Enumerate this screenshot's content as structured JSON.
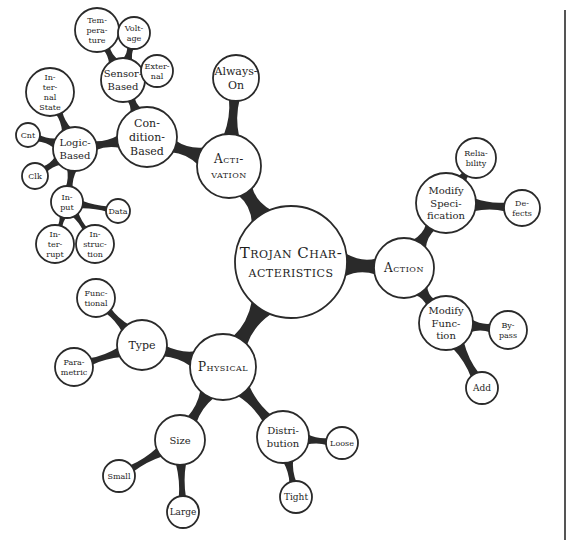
{
  "colors": {
    "stroke": "#2a2a2a",
    "fill": "#ffffff",
    "text": "#1e1e1e"
  },
  "nodes": [
    {
      "id": "root",
      "lines": [
        "Trojan Char-",
        "acteristics"
      ],
      "x": 291,
      "y": 262,
      "r": 56,
      "size": 15,
      "smallcaps": true
    },
    {
      "id": "activation",
      "lines": [
        "Acti-",
        "vation"
      ],
      "x": 229,
      "y": 166,
      "r": 32,
      "size": 12,
      "smallcaps": true
    },
    {
      "id": "action",
      "lines": [
        "Action"
      ],
      "x": 404,
      "y": 268,
      "r": 30,
      "size": 12,
      "smallcaps": true
    },
    {
      "id": "physical",
      "lines": [
        "Physical"
      ],
      "x": 223,
      "y": 367,
      "r": 33,
      "size": 12,
      "smallcaps": true
    },
    {
      "id": "always-on",
      "lines": [
        "Always-",
        "On"
      ],
      "x": 236,
      "y": 78,
      "r": 23,
      "size": 11
    },
    {
      "id": "condition-based",
      "lines": [
        "Con-",
        "dition-",
        "Based"
      ],
      "x": 147,
      "y": 137,
      "r": 30,
      "size": 11
    },
    {
      "id": "sensor-based",
      "lines": [
        "Sensor-",
        "Based"
      ],
      "x": 123,
      "y": 80,
      "r": 22,
      "size": 10
    },
    {
      "id": "temperature",
      "lines": [
        "Tem-",
        "pera-",
        "ture"
      ],
      "x": 97,
      "y": 30,
      "r": 22,
      "size": 8
    },
    {
      "id": "voltage",
      "lines": [
        "Volt-",
        "age"
      ],
      "x": 134,
      "y": 33,
      "r": 16,
      "size": 8
    },
    {
      "id": "external",
      "lines": [
        "Exter-",
        "nal"
      ],
      "x": 157,
      "y": 71,
      "r": 16,
      "size": 8
    },
    {
      "id": "logic-based",
      "lines": [
        "Logic-",
        "Based"
      ],
      "x": 75,
      "y": 149,
      "r": 22,
      "size": 10
    },
    {
      "id": "internal-state",
      "lines": [
        "In-",
        "ter-",
        "nal",
        "State"
      ],
      "x": 50,
      "y": 92,
      "r": 24,
      "size": 8
    },
    {
      "id": "cnt",
      "lines": [
        "Cnt"
      ],
      "x": 28,
      "y": 135,
      "r": 12,
      "size": 8
    },
    {
      "id": "clk",
      "lines": [
        "Clk"
      ],
      "x": 35,
      "y": 176,
      "r": 13,
      "size": 8
    },
    {
      "id": "input",
      "lines": [
        "In-",
        "put"
      ],
      "x": 67,
      "y": 202,
      "r": 16,
      "size": 8
    },
    {
      "id": "data",
      "lines": [
        "Data"
      ],
      "x": 118,
      "y": 211,
      "r": 12,
      "size": 8
    },
    {
      "id": "interrupt",
      "lines": [
        "In-",
        "ter-",
        "rupt"
      ],
      "x": 55,
      "y": 244,
      "r": 19,
      "size": 8
    },
    {
      "id": "instruction",
      "lines": [
        "In-",
        "struc-",
        "tion"
      ],
      "x": 95,
      "y": 244,
      "r": 19,
      "size": 8
    },
    {
      "id": "modify-specification",
      "lines": [
        "Modify",
        "Speci-",
        "fication"
      ],
      "x": 446,
      "y": 203,
      "r": 30,
      "size": 10
    },
    {
      "id": "reliability",
      "lines": [
        "Relia-",
        "bility"
      ],
      "x": 476,
      "y": 158,
      "r": 20,
      "size": 8
    },
    {
      "id": "defects",
      "lines": [
        "De-",
        "fects"
      ],
      "x": 522,
      "y": 208,
      "r": 18,
      "size": 8
    },
    {
      "id": "modify-function",
      "lines": [
        "Modify",
        "Func-",
        "tion"
      ],
      "x": 446,
      "y": 323,
      "r": 27,
      "size": 10
    },
    {
      "id": "bypass",
      "lines": [
        "By-",
        "pass"
      ],
      "x": 508,
      "y": 330,
      "r": 19,
      "size": 8
    },
    {
      "id": "add",
      "lines": [
        "Add"
      ],
      "x": 482,
      "y": 388,
      "r": 16,
      "size": 9
    },
    {
      "id": "type",
      "lines": [
        "Type"
      ],
      "x": 142,
      "y": 345,
      "r": 25,
      "size": 11
    },
    {
      "id": "functional",
      "lines": [
        "Func-",
        "tional"
      ],
      "x": 96,
      "y": 298,
      "r": 19,
      "size": 8
    },
    {
      "id": "parametric",
      "lines": [
        "Para-",
        "metric"
      ],
      "x": 74,
      "y": 367,
      "r": 19,
      "size": 8
    },
    {
      "id": "size",
      "lines": [
        "Size"
      ],
      "x": 180,
      "y": 440,
      "r": 25,
      "size": 10
    },
    {
      "id": "small",
      "lines": [
        "Small"
      ],
      "x": 119,
      "y": 476,
      "r": 16,
      "size": 8
    },
    {
      "id": "large",
      "lines": [
        "Large"
      ],
      "x": 183,
      "y": 512,
      "r": 16,
      "size": 9
    },
    {
      "id": "distribution",
      "lines": [
        "Distri-",
        "bution"
      ],
      "x": 283,
      "y": 437,
      "r": 26,
      "size": 10
    },
    {
      "id": "loose",
      "lines": [
        "Loose"
      ],
      "x": 342,
      "y": 443,
      "r": 16,
      "size": 8
    },
    {
      "id": "tight",
      "lines": [
        "Tight"
      ],
      "x": 296,
      "y": 497,
      "r": 16,
      "size": 9
    }
  ],
  "edges": [
    [
      "root",
      "activation",
      9
    ],
    [
      "root",
      "action",
      9
    ],
    [
      "root",
      "physical",
      9
    ],
    [
      "activation",
      "always-on",
      6
    ],
    [
      "activation",
      "condition-based",
      7
    ],
    [
      "condition-based",
      "sensor-based",
      5
    ],
    [
      "condition-based",
      "logic-based",
      5
    ],
    [
      "sensor-based",
      "temperature",
      4
    ],
    [
      "sensor-based",
      "voltage",
      4
    ],
    [
      "sensor-based",
      "external",
      4
    ],
    [
      "logic-based",
      "internal-state",
      4
    ],
    [
      "logic-based",
      "cnt",
      4
    ],
    [
      "logic-based",
      "clk",
      4
    ],
    [
      "logic-based",
      "input",
      4
    ],
    [
      "input",
      "data",
      3
    ],
    [
      "input",
      "interrupt",
      3
    ],
    [
      "input",
      "instruction",
      3
    ],
    [
      "action",
      "modify-specification",
      6
    ],
    [
      "action",
      "modify-function",
      6
    ],
    [
      "modify-specification",
      "reliability",
      5
    ],
    [
      "modify-specification",
      "defects",
      5
    ],
    [
      "modify-function",
      "bypass",
      5
    ],
    [
      "modify-function",
      "add",
      5
    ],
    [
      "physical",
      "type",
      6
    ],
    [
      "physical",
      "size",
      6
    ],
    [
      "physical",
      "distribution",
      6
    ],
    [
      "type",
      "functional",
      4
    ],
    [
      "type",
      "parametric",
      4
    ],
    [
      "size",
      "small",
      4
    ],
    [
      "size",
      "large",
      4
    ],
    [
      "distribution",
      "loose",
      4
    ],
    [
      "distribution",
      "tight",
      4
    ]
  ]
}
